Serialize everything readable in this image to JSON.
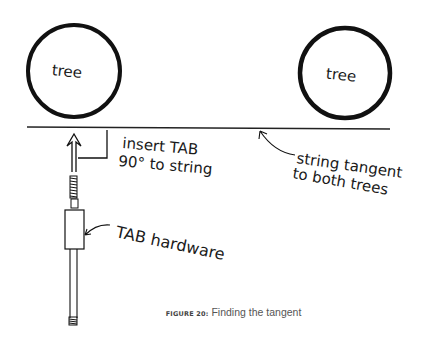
{
  "diagram": {
    "trees": [
      {
        "label": "tree",
        "cx": 74,
        "cy": 71,
        "r": 47
      },
      {
        "label": "tree",
        "cx": 345,
        "cy": 73,
        "r": 46
      }
    ],
    "string_line": {
      "x1": 27,
      "y1": 127,
      "x2": 390,
      "y2": 129
    },
    "annotations": {
      "insert_tab_line1": "insert TAB",
      "insert_tab_line2": "90° to string",
      "string_tangent_line1": "string tangent",
      "string_tangent_line2": "to both trees",
      "tab_hardware": "TAB hardware"
    },
    "colors": {
      "ink": "#111111",
      "caption_text": "#555555",
      "background": "#ffffff"
    }
  },
  "caption": {
    "figure_number": "FIGURE 20:",
    "text": " Finding the tangent"
  }
}
